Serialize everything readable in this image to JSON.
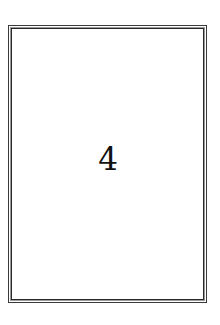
{
  "card": {
    "number": "4",
    "border_style": "double",
    "border_color": "#2a2a2a",
    "background": "#ffffff"
  }
}
